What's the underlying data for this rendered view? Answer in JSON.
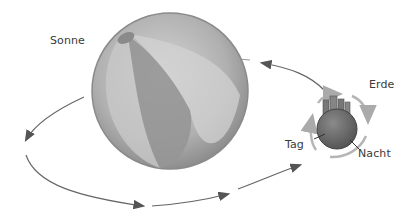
{
  "diagram": {
    "labels": {
      "sun": "Sonne",
      "earth": "Erde",
      "day": "Tag",
      "night": "Nacht"
    },
    "objects": {
      "sun": {
        "shape": "beach-ball",
        "shading": "grayscale"
      },
      "earth": {
        "shape": "sphere-with-buildings",
        "rotation": "clockwise"
      }
    },
    "orbit": {
      "direction": "counterclockwise",
      "arrow_count": 4
    },
    "colors": {
      "ink": "#555555",
      "sun_light": "#cfcfcf",
      "sun_mid": "#a8a8a8",
      "sun_dark": "#8a8a8a",
      "earth": "#6e6e6e",
      "earth_arrows": "#b5b5b5"
    }
  }
}
